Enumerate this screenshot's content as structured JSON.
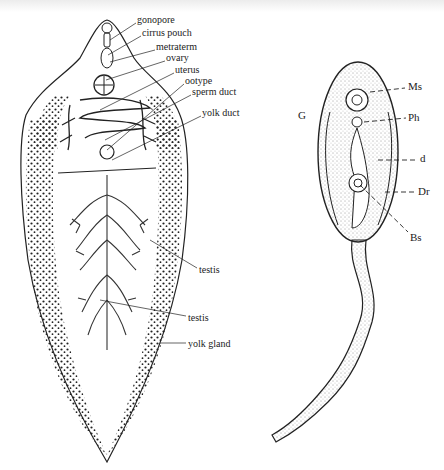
{
  "figure": {
    "left_specimen": {
      "description": "adult fluke",
      "labels": [
        {
          "key": "gonopore",
          "text": "gonopore",
          "x": 137,
          "y": 20
        },
        {
          "key": "cirrus_pouch",
          "text": "cirrus pouch",
          "x": 142,
          "y": 33
        },
        {
          "key": "metraterm",
          "text": "metraterm",
          "x": 156,
          "y": 47
        },
        {
          "key": "ovary",
          "text": "ovary",
          "x": 166,
          "y": 58
        },
        {
          "key": "uterus",
          "text": "uterus",
          "x": 175,
          "y": 70
        },
        {
          "key": "ootype",
          "text": "ootype",
          "x": 185,
          "y": 81
        },
        {
          "key": "sperm_duct",
          "text": "sperm duct",
          "x": 192,
          "y": 92
        },
        {
          "key": "yolk_duct",
          "text": "yolk duct",
          "x": 202,
          "y": 113
        },
        {
          "key": "testis_1",
          "text": "testis",
          "x": 199,
          "y": 265
        },
        {
          "key": "testis_2",
          "text": "testis",
          "x": 188,
          "y": 313
        },
        {
          "key": "yolk_gland",
          "text": "yolk gland",
          "x": 188,
          "y": 340
        }
      ]
    },
    "right_specimen": {
      "description": "cercaria",
      "labels": [
        {
          "key": "Ms",
          "text": "Ms",
          "x": 410,
          "y": 85
        },
        {
          "key": "G",
          "text": "G",
          "x": 300,
          "y": 114
        },
        {
          "key": "Ph",
          "text": "Ph",
          "x": 410,
          "y": 114
        },
        {
          "key": "d",
          "text": "d",
          "x": 420,
          "y": 155
        },
        {
          "key": "Dr",
          "text": "Dr",
          "x": 420,
          "y": 187
        },
        {
          "key": "Bs",
          "text": "Bs",
          "x": 412,
          "y": 231
        }
      ]
    }
  },
  "colors": {
    "ink": "#222222",
    "paper": "#ffffff"
  }
}
